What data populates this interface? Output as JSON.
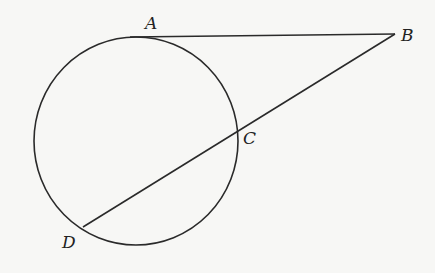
{
  "diagram": {
    "type": "geometry",
    "stroke_color": "#2a2a2a",
    "background_color": "#f7f7f5",
    "circle": {
      "cx": 136,
      "cy": 141,
      "rx": 102,
      "ry": 104
    },
    "points": {
      "A": {
        "label": "A",
        "x": 130,
        "y": 37
      },
      "B": {
        "label": "B",
        "x": 395,
        "y": 34
      },
      "C": {
        "label": "C",
        "x": 237,
        "y": 131
      },
      "D": {
        "label": "D",
        "x": 83,
        "y": 227
      }
    },
    "segments": [
      {
        "name": "tangent-AB",
        "from": "A",
        "to": "B"
      },
      {
        "name": "secant-BD",
        "from": "B",
        "to": "D"
      }
    ],
    "labels": {
      "A": {
        "text": "A",
        "x": 145,
        "y": 29
      },
      "B": {
        "text": "B",
        "x": 401,
        "y": 41
      },
      "C": {
        "text": "C",
        "x": 243,
        "y": 144
      },
      "D": {
        "text": "D",
        "x": 62,
        "y": 248
      }
    }
  }
}
